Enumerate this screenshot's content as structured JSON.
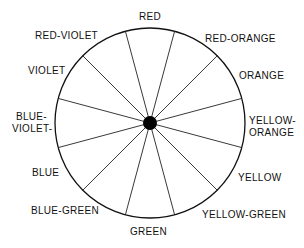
{
  "diagram": {
    "type": "color-wheel",
    "center": {
      "x": 150,
      "y": 123
    },
    "radius": 95,
    "spoke_count": 12,
    "line_color": "#111111",
    "hub_color": "#000000",
    "labels": [
      {
        "id": "red",
        "text": "RED",
        "x": 139,
        "y": 11
      },
      {
        "id": "red-orange",
        "text": "RED-ORANGE",
        "x": 205,
        "y": 33
      },
      {
        "id": "orange",
        "text": "ORANGE",
        "x": 239,
        "y": 70
      },
      {
        "id": "yellow-orange-1",
        "text": "YELLOW-",
        "x": 249,
        "y": 115
      },
      {
        "id": "yellow-orange-2",
        "text": "ORANGE",
        "x": 249,
        "y": 127
      },
      {
        "id": "yellow",
        "text": "YELLOW",
        "x": 238,
        "y": 172
      },
      {
        "id": "yellow-green",
        "text": "YELLOW-GREEN",
        "x": 202,
        "y": 209
      },
      {
        "id": "green",
        "text": "GREEN",
        "x": 130,
        "y": 226
      },
      {
        "id": "blue-green",
        "text": "BLUE-GREEN",
        "x": 31,
        "y": 205
      },
      {
        "id": "blue",
        "text": "BLUE",
        "x": 32,
        "y": 167
      },
      {
        "id": "blue-violet-1",
        "text": "BLUE-",
        "x": 16,
        "y": 111
      },
      {
        "id": "blue-violet-2",
        "text": "VIOLET-",
        "x": 12,
        "y": 123
      },
      {
        "id": "violet",
        "text": "VIOLET",
        "x": 28,
        "y": 65
      },
      {
        "id": "red-violet",
        "text": "RED-VIOLET",
        "x": 35,
        "y": 30
      }
    ]
  }
}
